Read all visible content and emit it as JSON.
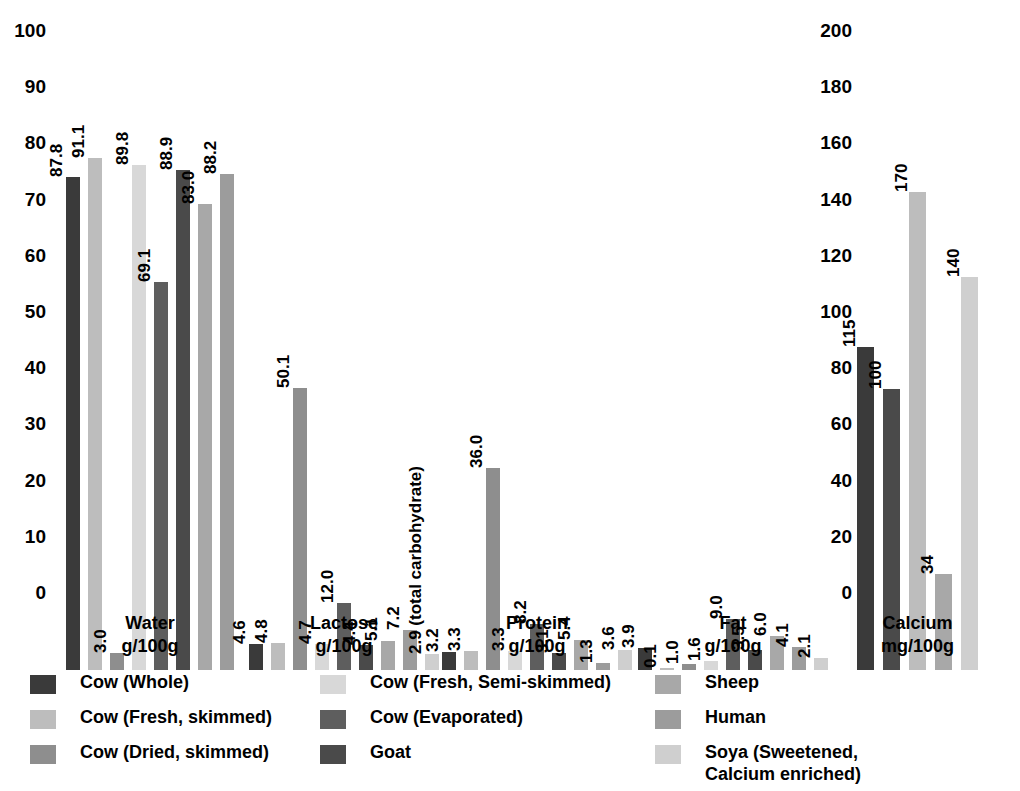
{
  "chart_data": {
    "type": "bar",
    "title": "",
    "subtitle": "",
    "xlabel": "",
    "ylabel": "",
    "grid": false,
    "legend_position": "bottom",
    "axes": [
      {
        "name": "left-axis",
        "ylim": [
          0,
          100
        ],
        "yticks": [
          0,
          10,
          20,
          30,
          40,
          50,
          60,
          70,
          80,
          90,
          100
        ],
        "ytick_labels": [
          "0",
          "10",
          "20",
          "30",
          "40",
          "50",
          "60",
          "70",
          "80",
          "90",
          "100"
        ],
        "groups": [
          "Water\ng/100g",
          "Lactose\ng/100g",
          "Protein\ng/100g",
          "Fat\ng/100g"
        ]
      },
      {
        "name": "right-axis",
        "ylim": [
          0,
          200
        ],
        "yticks": [
          0,
          20,
          40,
          60,
          80,
          100,
          120,
          140,
          160,
          180,
          200
        ],
        "ytick_labels": [
          "0",
          "20",
          "40",
          "60",
          "80",
          "100",
          "120",
          "140",
          "160",
          "180",
          "200"
        ],
        "groups": [
          "Calcium\nmg/100g"
        ]
      }
    ],
    "categories": [
      "Water g/100g",
      "Lactose g/100g",
      "Protein g/100g",
      "Fat g/100g",
      "Calcium mg/100g"
    ],
    "series": [
      {
        "name": "Cow (Whole)",
        "color": "#3a3a3a",
        "values": [
          87.8,
          4.6,
          3.2,
          3.9,
          115
        ]
      },
      {
        "name": "Cow (Fresh, skimmed)",
        "color": "#bdbdbd",
        "values": [
          91.1,
          4.8,
          3.3,
          0.1,
          100
        ]
      },
      {
        "name": "Cow (Dried, skimmed)",
        "color": "#8e8e8e",
        "values": [
          3.0,
          50.1,
          36.0,
          1.0,
          170
        ]
      },
      {
        "name": "Cow (Fresh, Semi-skimmed)",
        "color": "#d8d8d8",
        "values": [
          89.8,
          4.7,
          3.3,
          1.6,
          null
        ]
      },
      {
        "name": "Cow (Evaporated)",
        "color": "#5e5e5e",
        "values": [
          69.1,
          12.0,
          8.2,
          9.0,
          null
        ]
      },
      {
        "name": "Goat",
        "color": "#4a4a4a",
        "values": [
          88.9,
          4.4,
          3.1,
          3.5,
          null
        ]
      },
      {
        "name": "Sheep",
        "color": "#a8a8a8",
        "values": [
          83.0,
          5.1,
          5.4,
          6.0,
          34
        ]
      },
      {
        "name": "Human",
        "color": "#9c9c9c",
        "values": [
          88.2,
          7.2,
          1.3,
          4.1,
          140
        ]
      },
      {
        "name": "Soya (Sweetened, Calcium enriched)",
        "color": "#cfcfcf",
        "values": [
          null,
          2.9,
          3.6,
          2.1,
          null
        ]
      }
    ],
    "annotations": [
      {
        "text": "(total carbohydrate)",
        "attached_to": "Lactose / Soya (Sweetened, Calcium enriched)"
      }
    ]
  },
  "left_axis": {
    "ticks": [
      "100",
      "90",
      "80",
      "70",
      "60",
      "50",
      "40",
      "30",
      "20",
      "10",
      "0"
    ]
  },
  "right_axis": {
    "ticks": [
      "200",
      "180",
      "160",
      "140",
      "120",
      "100",
      "80",
      "60",
      "40",
      "20",
      "0"
    ]
  },
  "groups": [
    {
      "name": "water",
      "caption_line1": "Water",
      "caption_line2": "g/100g",
      "bars": [
        {
          "label": "87.8",
          "value": 87.8,
          "color": "#3a3a3a",
          "series": "Cow (Whole)"
        },
        {
          "label": "91.1",
          "value": 91.1,
          "color": "#bdbdbd",
          "series": "Cow (Fresh, skimmed)"
        },
        {
          "label": "3.0",
          "value": 3.0,
          "color": "#8e8e8e",
          "series": "Cow (Dried, skimmed)"
        },
        {
          "label": "89.8",
          "value": 89.8,
          "color": "#d8d8d8",
          "series": "Cow (Fresh, Semi-skimmed)"
        },
        {
          "label": "69.1",
          "value": 69.1,
          "color": "#5e5e5e",
          "series": "Cow (Evaporated)"
        },
        {
          "label": "88.9",
          "value": 88.9,
          "color": "#4a4a4a",
          "series": "Goat"
        },
        {
          "label": "83.0",
          "value": 83.0,
          "color": "#a8a8a8",
          "series": "Sheep"
        },
        {
          "label": "88.2",
          "value": 88.2,
          "color": "#9c9c9c",
          "series": "Human"
        }
      ]
    },
    {
      "name": "lactose",
      "caption_line1": "Lactose",
      "caption_line2": "g/100g",
      "bars": [
        {
          "label": "4.6",
          "value": 4.6,
          "color": "#3a3a3a",
          "series": "Cow (Whole)"
        },
        {
          "label": "4.8",
          "value": 4.8,
          "color": "#bdbdbd",
          "series": "Cow (Fresh, skimmed)"
        },
        {
          "label": "50.1",
          "value": 50.1,
          "color": "#8e8e8e",
          "series": "Cow (Dried, skimmed)"
        },
        {
          "label": "4.7",
          "value": 4.7,
          "color": "#d8d8d8",
          "series": "Cow (Fresh, Semi-skimmed)"
        },
        {
          "label": "12.0",
          "value": 12.0,
          "color": "#5e5e5e",
          "series": "Cow (Evaporated)"
        },
        {
          "label": "4.4",
          "value": 4.4,
          "color": "#4a4a4a",
          "series": "Goat"
        },
        {
          "label": "5.1",
          "value": 5.1,
          "color": "#a8a8a8",
          "series": "Sheep"
        },
        {
          "label": "7.2",
          "value": 7.2,
          "color": "#9c9c9c",
          "series": "Human"
        },
        {
          "label": "2.9 (total carbohydrate)",
          "value": 2.9,
          "color": "#cfcfcf",
          "series": "Soya (Sweetened, Calcium enriched)"
        }
      ]
    },
    {
      "name": "protein",
      "caption_line1": "Protein",
      "caption_line2": "g/100g",
      "bars": [
        {
          "label": "3.2",
          "value": 3.2,
          "color": "#3a3a3a",
          "series": "Cow (Whole)"
        },
        {
          "label": "3.3",
          "value": 3.3,
          "color": "#bdbdbd",
          "series": "Cow (Fresh, skimmed)"
        },
        {
          "label": "36.0",
          "value": 36.0,
          "color": "#8e8e8e",
          "series": "Cow (Dried, skimmed)"
        },
        {
          "label": "3.3",
          "value": 3.3,
          "color": "#d8d8d8",
          "series": "Cow (Fresh, Semi-skimmed)"
        },
        {
          "label": "8.2",
          "value": 8.2,
          "color": "#5e5e5e",
          "series": "Cow (Evaporated)"
        },
        {
          "label": "3.1",
          "value": 3.1,
          "color": "#4a4a4a",
          "series": "Goat"
        },
        {
          "label": "5.4",
          "value": 5.4,
          "color": "#a8a8a8",
          "series": "Sheep"
        },
        {
          "label": "1.3",
          "value": 1.3,
          "color": "#9c9c9c",
          "series": "Human"
        },
        {
          "label": "3.6",
          "value": 3.6,
          "color": "#cfcfcf",
          "series": "Soya (Sweetened, Calcium enriched)"
        }
      ]
    },
    {
      "name": "fat",
      "caption_line1": "Fat",
      "caption_line2": "g/100g",
      "bars": [
        {
          "label": "3.9",
          "value": 3.9,
          "color": "#3a3a3a",
          "series": "Cow (Whole)"
        },
        {
          "label": "0.1",
          "value": 0.1,
          "color": "#bdbdbd",
          "series": "Cow (Fresh, skimmed)"
        },
        {
          "label": "1.0",
          "value": 1.0,
          "color": "#8e8e8e",
          "series": "Cow (Dried, skimmed)"
        },
        {
          "label": "1.6",
          "value": 1.6,
          "color": "#d8d8d8",
          "series": "Cow (Fresh, Semi-skimmed)"
        },
        {
          "label": "9.0",
          "value": 9.0,
          "color": "#5e5e5e",
          "series": "Cow (Evaporated)"
        },
        {
          "label": "3.5",
          "value": 3.5,
          "color": "#4a4a4a",
          "series": "Goat"
        },
        {
          "label": "6.0",
          "value": 6.0,
          "color": "#a8a8a8",
          "series": "Sheep"
        },
        {
          "label": "4.1",
          "value": 4.1,
          "color": "#9c9c9c",
          "series": "Human"
        },
        {
          "label": "2.1",
          "value": 2.1,
          "color": "#cfcfcf",
          "series": "Soya (Sweetened, Calcium enriched)"
        }
      ]
    }
  ],
  "calcium_group": {
    "name": "calcium",
    "caption_line1": "Calcium",
    "caption_line2": "mg/100g",
    "bars": [
      {
        "label": "115",
        "value": 115,
        "color": "#3a3a3a",
        "series": "Cow (Whole)"
      },
      {
        "label": "100",
        "value": 100,
        "color": "#4a4a4a",
        "series": "Cow (Fresh, skimmed)"
      },
      {
        "label": "170",
        "value": 170,
        "color": "#bdbdbd",
        "series": "Cow (Dried, skimmed)"
      },
      {
        "label": "34",
        "value": 34,
        "color": "#a8a8a8",
        "series": "Sheep"
      },
      {
        "label": "140",
        "value": 140,
        "color": "#cfcfcf",
        "series": "Human"
      }
    ]
  },
  "legend": {
    "columns": [
      {
        "items": [
          {
            "label": "Cow (Whole)",
            "color": "#3a3a3a"
          },
          {
            "label": "Cow (Fresh, skimmed)",
            "color": "#bdbdbd"
          },
          {
            "label": "Cow (Dried, skimmed)",
            "color": "#8e8e8e"
          }
        ]
      },
      {
        "items": [
          {
            "label": "Cow (Fresh, Semi-skimmed)",
            "color": "#d8d8d8"
          },
          {
            "label": "Cow (Evaporated)",
            "color": "#5e5e5e"
          },
          {
            "label": "Goat",
            "color": "#4a4a4a"
          }
        ]
      },
      {
        "items": [
          {
            "label": "Sheep",
            "color": "#a8a8a8"
          },
          {
            "label": "Human",
            "color": "#9c9c9c"
          },
          {
            "label": "Soya (Sweetened,\nCalcium enriched)",
            "color": "#cfcfcf"
          }
        ]
      }
    ]
  }
}
